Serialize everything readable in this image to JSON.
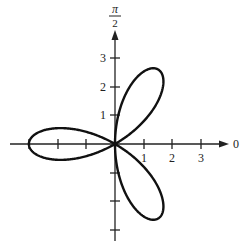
{
  "chart_data": {
    "type": "line",
    "title": "",
    "equation": "r = -3 cos(3θ)",
    "coordinate_system": "polar",
    "petal_directions_deg": [
      60,
      180,
      300
    ],
    "max_radius": 3,
    "axis_labels": {
      "polar_axis": "0",
      "vertical_axis": "π/2"
    },
    "x_ticks": [
      "1",
      "2",
      "3"
    ],
    "y_ticks": [
      "1",
      "2",
      "3"
    ],
    "grid": false,
    "legend": null
  },
  "labels": {
    "zero": "0",
    "pi_num": "π",
    "pi_den": "2",
    "x1": "1",
    "x2": "2",
    "x3": "3",
    "y1": "1",
    "y2": "2",
    "y3": "3"
  },
  "colors": {
    "curve": "#111111",
    "axis": "#222222",
    "background": "#ffffff"
  }
}
